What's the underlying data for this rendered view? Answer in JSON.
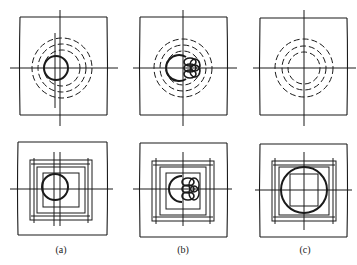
{
  "figure": {
    "panels": [
      {
        "id": "a",
        "label": "(a)"
      },
      {
        "id": "b",
        "label": "(b)"
      },
      {
        "id": "c",
        "label": "(c)"
      }
    ],
    "colors": {
      "line": "#1a1a1a",
      "background": "#ffffff"
    }
  }
}
